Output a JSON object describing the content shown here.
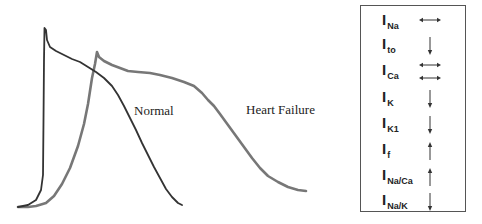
{
  "figure": {
    "curves": {
      "normal": {
        "label": "Normal",
        "color": "#333333",
        "points": "18,207 28,205 36,200 41,190 43,175 43.5,120 44,60 44.5,28 46,30 47,40 50,47 56,51 64,55 72,59 80,62 88,67 96,72 104,78 112,86 118,95 124,106 130,118 136,130 142,143 148,155 154,167 160,178 166,189 172,197 178,203 182,205"
      },
      "heart_failure": {
        "label": "Heart Failure",
        "color": "#777777",
        "points": "18,207 28,207 36,206 46,203 54,196 62,184 70,168 78,146 84,124 88,104 92,78 95,64 97,52 99,57 104,61 112,65 120,68 128,71 138,72 150,73 160,75 172,78 184,82 194,86 202,93 208,100 214,106 220,114 228,125 236,136 244,147 252,158 260,168 268,176 278,182 288,187 298,190 306,191"
      }
    },
    "labels": {
      "normal": "Normal",
      "heart_failure": "Heart Failure"
    }
  },
  "legend": {
    "rows": [
      {
        "main": "I",
        "sub": "Na",
        "arrow": "double-horizontal",
        "arrow_count": 1
      },
      {
        "main": "I",
        "sub": "to",
        "arrow": "down",
        "arrow_count": 1
      },
      {
        "main": "I",
        "sub": "Ca",
        "arrow": "double-horizontal",
        "arrow_count": 2
      },
      {
        "main": "I",
        "sub": "K",
        "arrow": "down",
        "arrow_count": 1
      },
      {
        "main": "I",
        "sub": "K1",
        "arrow": "down",
        "arrow_count": 1
      },
      {
        "main": "I",
        "sub": "f",
        "arrow": "up",
        "arrow_count": 1
      },
      {
        "main": "I",
        "sub": "Na/Ca",
        "arrow": "up",
        "arrow_count": 1
      },
      {
        "main": "I",
        "sub": "Na/K",
        "arrow": "down",
        "arrow_count": 1
      }
    ]
  }
}
